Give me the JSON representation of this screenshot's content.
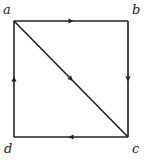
{
  "diagram": {
    "type": "directed-graph",
    "nodes": [
      {
        "id": "a",
        "label": "a",
        "position": "top-left"
      },
      {
        "id": "b",
        "label": "b",
        "position": "top-right"
      },
      {
        "id": "c",
        "label": "c",
        "position": "bottom-right"
      },
      {
        "id": "d",
        "label": "d",
        "position": "bottom-left"
      }
    ],
    "edges": [
      {
        "from": "a",
        "to": "b"
      },
      {
        "from": "b",
        "to": "c"
      },
      {
        "from": "c",
        "to": "d"
      },
      {
        "from": "d",
        "to": "a"
      },
      {
        "from": "a",
        "to": "c"
      }
    ],
    "colors": {
      "stroke": "#222222",
      "background": "#ffffff"
    }
  }
}
